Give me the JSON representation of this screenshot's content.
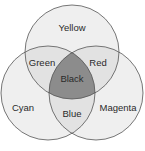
{
  "diagram": {
    "type": "venn",
    "sets": [
      {
        "name": "Yellow",
        "label": "Yellow"
      },
      {
        "name": "Cyan",
        "label": "Cyan"
      },
      {
        "name": "Magenta",
        "label": "Magenta"
      }
    ],
    "intersections": {
      "yellow_cyan": "Green",
      "yellow_magenta": "Red",
      "cyan_magenta": "Blue",
      "all": "Black"
    },
    "colors": {
      "single": "#efefef",
      "double": "#e2e2e2",
      "triple": "#8c8c8c",
      "stroke": "#555555"
    }
  }
}
